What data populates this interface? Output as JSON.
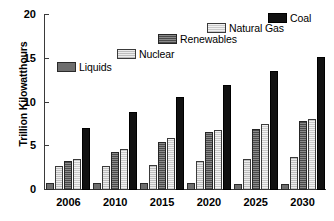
{
  "chart_data": {
    "type": "bar",
    "title": "",
    "xlabel": "",
    "ylabel": "Trillion Kilowatthours",
    "categories": [
      "2006",
      "2010",
      "2015",
      "2020",
      "2025",
      "2030"
    ],
    "ylim": [
      0,
      20
    ],
    "yticks": [
      0,
      5,
      10,
      15,
      20
    ],
    "ytick_labels": [
      "0",
      "5",
      "10",
      "15",
      "20"
    ],
    "grid": false,
    "legend_position": "inside-staircase",
    "series": [
      {
        "name": "Liquids",
        "color": "#6e6e6e",
        "values": [
          0.8,
          0.8,
          0.8,
          0.8,
          0.7,
          0.7
        ]
      },
      {
        "name": "Nuclear",
        "color": "#d9d9d9",
        "values": [
          2.7,
          2.7,
          2.9,
          3.3,
          3.5,
          3.8
        ]
      },
      {
        "name": "Renewables",
        "color": "#6a6a6a",
        "values": [
          3.3,
          4.4,
          5.5,
          6.6,
          7.0,
          7.9
        ]
      },
      {
        "name": "Natural Gas",
        "color": "#dedede",
        "values": [
          3.6,
          4.7,
          5.9,
          6.9,
          7.5,
          8.1
        ]
      },
      {
        "name": "Coal",
        "color": "#111111",
        "values": [
          7.1,
          8.9,
          10.6,
          12.0,
          13.6,
          15.2
        ]
      }
    ]
  },
  "axis": {
    "y_title": "Trillion Kilowatthours"
  },
  "legend": {
    "items": [
      {
        "label": "Liquids"
      },
      {
        "label": "Nuclear"
      },
      {
        "label": "Renewables"
      },
      {
        "label": "Natural Gas"
      },
      {
        "label": "Coal"
      }
    ]
  }
}
